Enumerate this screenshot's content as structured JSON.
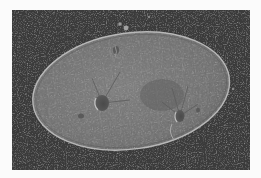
{
  "image": {
    "alt": "Micrograph of a ciliate protozoan (Paramecium-like cell) showing an oval cell body with two contractile vacuoles and radiating canals on a dark background",
    "subject": "paramecium-cell",
    "background_color": "#3c3c3c",
    "border_color": "#fbfbfb",
    "cell_fill_color": "#7a7a7a",
    "cell_edge_color": "#b5b5b5",
    "features": [
      {
        "name": "left-contractile-vacuole",
        "cx": 90,
        "cy": 93
      },
      {
        "name": "right-contractile-vacuole",
        "cx": 168,
        "cy": 106
      },
      {
        "name": "particle-cluster-top",
        "cx": 112,
        "cy": 17
      }
    ]
  }
}
